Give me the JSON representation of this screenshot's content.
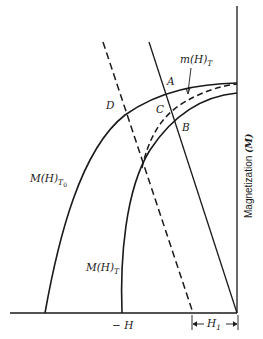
{
  "diagram": {
    "type": "magnetization-curves",
    "colors": {
      "ink": "#1a1a1a",
      "background": "#ffffff"
    },
    "axes": {
      "vertical_label": "Magnetization",
      "vertical_label_symbol": "(M)",
      "horizontal_label": "− H",
      "interval_label": "H",
      "interval_subscript": "1"
    },
    "curves": [
      {
        "id": "M_H_T0",
        "label": "M(H)",
        "subscript": "T",
        "subsubscript": "0",
        "style": "solid"
      },
      {
        "id": "M_H_T",
        "label": "M(H)",
        "subscript": "T",
        "style": "solid"
      },
      {
        "id": "m_H_T",
        "label": "m(H)",
        "subscript": "T",
        "style": "dashed"
      }
    ],
    "lines": [
      {
        "id": "solid-line",
        "style": "solid"
      },
      {
        "id": "dashed-line",
        "style": "dashed"
      }
    ],
    "points": [
      {
        "id": "A",
        "label": "A"
      },
      {
        "id": "B",
        "label": "B"
      },
      {
        "id": "C",
        "label": "C"
      },
      {
        "id": "D",
        "label": "D"
      }
    ]
  }
}
